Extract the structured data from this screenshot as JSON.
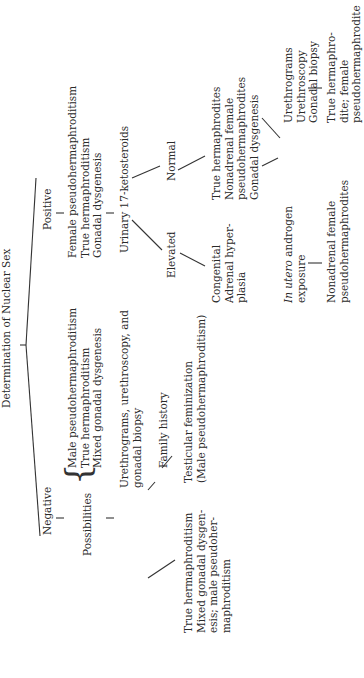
{
  "title": "Determination of Nuclear Sex",
  "negative": {
    "label": "Negative",
    "possibilities_label": "Possibilities",
    "possibilities": [
      "Male pseudohermaphroditism",
      "True hermaphroditism",
      "Mixed gonadal dysgenesis"
    ],
    "test": [
      "Urethrograms, urethroscopy, and",
      "gonadal biopsy"
    ],
    "test_result": [
      "True hermaphroditism",
      "Mixed gonadal dysgen-",
      "esis; male pseudoher-",
      "maphroditism"
    ],
    "family_history": "Family history",
    "family_result": [
      "Testicular feminization",
      "(Male pseudohermaphroditism)"
    ]
  },
  "positive": {
    "label": "Positive",
    "possibilities": [
      "Female pseudohermaphroditism",
      "True hermaphroditism",
      "Gonadal dysgenesis"
    ],
    "test": "Urinary 17-ketosteroids",
    "elevated": {
      "label": "Elevated",
      "result": [
        "Congenital",
        "Adrenal hyper-",
        "plasia"
      ]
    },
    "normal": {
      "label": "Normal",
      "result": [
        "True hermaphrodites",
        "Nonadrenal female",
        "pseudohermaphrodites",
        "Gonadal dysgenesis"
      ],
      "in_utero": {
        "label_italic": "In utero",
        "label_rest": " androgen",
        "label_line2": "exposure",
        "result": [
          "Nonadrenal female",
          "pseudohermaphrodites"
        ]
      },
      "other": {
        "tests": [
          "Urethrograms",
          "Urethroscopy",
          "Gonadal biopsy"
        ],
        "result": [
          "True hermaphro-",
          "dite; female",
          "pseudohermaphrodite"
        ]
      }
    }
  }
}
